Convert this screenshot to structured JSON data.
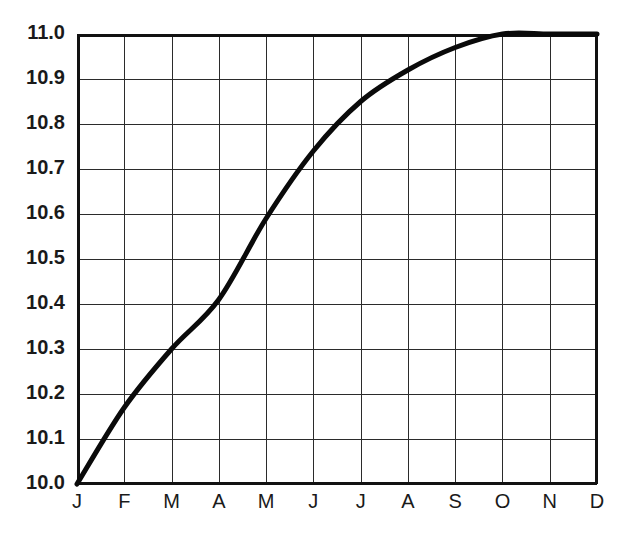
{
  "chart_data": {
    "type": "line",
    "title": "",
    "subtitle": "",
    "xlabel": "",
    "ylabel": "",
    "categories": [
      "J",
      "F",
      "M",
      "A",
      "M",
      "J",
      "J",
      "A",
      "S",
      "O",
      "N",
      "D"
    ],
    "x_tick_labels": [
      "J",
      "F",
      "M",
      "A",
      "M",
      "J",
      "J",
      "A",
      "S",
      "O",
      "N",
      "D"
    ],
    "y_tick_labels": [
      "10.0",
      "10.1",
      "10.2",
      "10.3",
      "10.4",
      "10.5",
      "10.6",
      "10.7",
      "10.8",
      "10.9",
      "11.0"
    ],
    "y_tick_values": [
      10.0,
      10.1,
      10.2,
      10.3,
      10.4,
      10.5,
      10.6,
      10.7,
      10.8,
      10.9,
      11.0
    ],
    "values": [
      10.0,
      10.17,
      10.3,
      10.41,
      10.59,
      10.74,
      10.85,
      10.92,
      10.97,
      11.0,
      11.0,
      11.0
    ],
    "series": [
      {
        "name": "growth-curve",
        "values": [
          10.0,
          10.17,
          10.3,
          10.41,
          10.59,
          10.74,
          10.85,
          10.92,
          10.97,
          11.0,
          11.0,
          11.0
        ]
      }
    ],
    "ylim": [
      10.0,
      11.0
    ],
    "xlim": [
      0,
      11
    ],
    "grid": true,
    "grid_x": true,
    "grid_y": true,
    "legend": false,
    "legend_position": "none",
    "annotations": [],
    "line_color": "#0a0a0a",
    "grid_color": "#2b2b2b",
    "axis_color": "#111111",
    "background_color": "#ffffff"
  },
  "layout": {
    "plot_left": 77,
    "plot_right": 597,
    "plot_top": 34,
    "plot_bottom": 484,
    "width": 637,
    "height": 538
  }
}
